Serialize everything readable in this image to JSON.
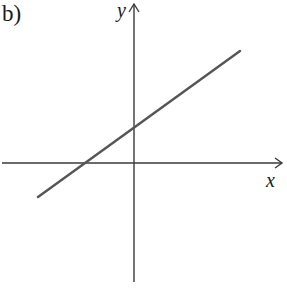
{
  "figure": {
    "panel_label": "b)",
    "x_axis_label": "x",
    "y_axis_label": "y",
    "colors": {
      "axes": "#3a3a3a",
      "line": "#555555",
      "background": "#ffffff"
    }
  },
  "geometry": {
    "x_axis": {
      "x1": 2,
      "y1": 163,
      "x2": 282,
      "y2": 163
    },
    "y_axis": {
      "x1": 134,
      "y1": 282,
      "x2": 134,
      "y2": 4
    },
    "line": {
      "x1": 38,
      "y1": 197,
      "x2": 240,
      "y2": 51
    }
  },
  "description": {
    "type": "linear function graph",
    "slope_sign": "positive",
    "y_intercept_sign": "positive",
    "x_intercept_sign": "negative"
  }
}
